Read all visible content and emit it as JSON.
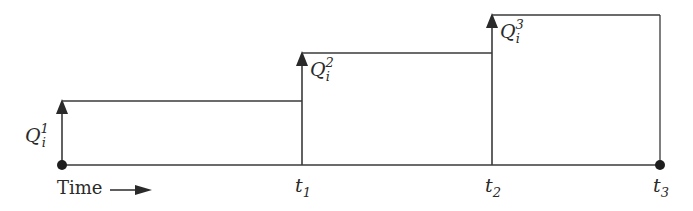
{
  "diagram": {
    "type": "step-inventory-timeline",
    "x_axis_label": "Time",
    "steps": [
      {
        "id": "Q1",
        "label_main": "Q",
        "label_sub": "i",
        "label_sup": "1",
        "start": "origin",
        "end": "t1"
      },
      {
        "id": "Q2",
        "label_main": "Q",
        "label_sub": "i",
        "label_sup": "2",
        "start": "t1",
        "end": "t2"
      },
      {
        "id": "Q3",
        "label_main": "Q",
        "label_sub": "i",
        "label_sup": "3",
        "start": "t2",
        "end": "t3"
      }
    ],
    "ticks": [
      {
        "main": "t",
        "sub": "1"
      },
      {
        "main": "t",
        "sub": "2"
      },
      {
        "main": "t",
        "sub": "3"
      }
    ],
    "colors": {
      "line": "#3a3a3a",
      "text": "#2a2a2a",
      "background": "#ffffff"
    }
  }
}
